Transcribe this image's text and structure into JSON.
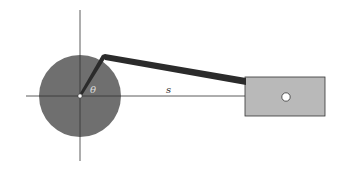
{
  "diagram": {
    "labels": {
      "angle": "θ",
      "displacement": "s"
    },
    "colors": {
      "background": "#ffffff",
      "crank_disk": "#6f6f6f",
      "rod": "#2b2b2b",
      "slider_block": "#b9b9b9",
      "axes": "#333333",
      "pin_hole": "#ffffff"
    },
    "components": [
      "coordinate-axes",
      "crank-disk",
      "crank-arm",
      "connecting-rod",
      "slider-block",
      "slider-pin"
    ]
  }
}
